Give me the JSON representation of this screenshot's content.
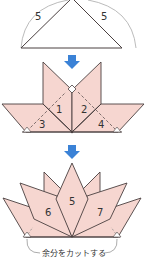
{
  "colors": {
    "petal_fill": "#f6d6d0",
    "outline": "#4a4040",
    "arrow": "#3b82d6",
    "guide": "#999999"
  },
  "step1": {
    "side_left_label": "5",
    "side_right_label": "5"
  },
  "step2": {
    "labels": [
      "1",
      "2",
      "3",
      "4"
    ]
  },
  "step3": {
    "labels": [
      "5",
      "6",
      "7"
    ],
    "caption": "余分をカットする"
  }
}
